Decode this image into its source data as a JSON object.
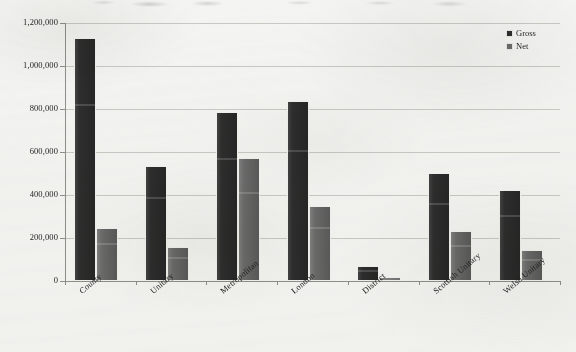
{
  "chart_data": {
    "type": "bar",
    "title": "",
    "xlabel": "",
    "ylabel": "",
    "categories": [
      "County",
      "Unitary",
      "Metropolitan",
      "London",
      "District",
      "Scottish Unitary",
      "Welsh Unitary"
    ],
    "series": [
      {
        "name": "Gross",
        "color": "#2e2e2e",
        "values": [
          1130000,
          535000,
          786000,
          837000,
          70000,
          502000,
          423000
        ]
      },
      {
        "name": "Net",
        "color": "#6b6b6b",
        "values": [
          246000,
          158000,
          572000,
          349000,
          19000,
          233000,
          144000
        ]
      }
    ],
    "ylim": [
      0,
      1200000
    ],
    "ytick_values": [
      0,
      200000,
      400000,
      600000,
      800000,
      1000000,
      1200000
    ],
    "ytick_labels": [
      "0",
      "200,000",
      "400,000",
      "600,000",
      "800,000",
      "1,000,000",
      "1,200,000"
    ],
    "grid": true,
    "legend_position": "top-right",
    "orientation": "vertical",
    "xtick_label_rotation": -40
  },
  "legend": {
    "items": [
      {
        "label": "Gross",
        "swatch": "gross"
      },
      {
        "label": "Net",
        "swatch": "net"
      }
    ]
  }
}
